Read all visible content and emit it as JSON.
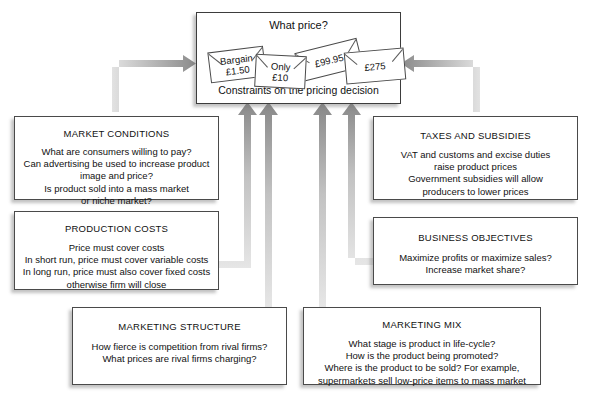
{
  "diagram": {
    "title": "Constraints on the pricing decision",
    "central": {
      "question": "What price?",
      "caption": "Constraints on the pricing decision",
      "price_tags": [
        {
          "name": "tag-bargain",
          "line1": "Bargain",
          "line2": "£1.50"
        },
        {
          "name": "tag-only-ten",
          "line1": "Only",
          "line2": "£10"
        },
        {
          "name": "tag-ninetynine",
          "line1": "£99.95",
          "line2": ""
        },
        {
          "name": "tag-twoseventyfive",
          "line1": "£275",
          "line2": ""
        }
      ]
    },
    "boxes": {
      "market_conditions": {
        "title": "MARKET CONDITIONS",
        "body": "What are consumers willing to pay?\nCan advertising be used to increase product\nimage and price?\nIs product sold into a mass market\nor niche market?"
      },
      "production_costs": {
        "title": "PRODUCTION COSTS",
        "body": "Price must cover costs\nIn short run, price must cover variable costs\nIn long run, price must also cover fixed costs\notherwise firm will close"
      },
      "taxes_and_subsidies": {
        "title": "TAXES AND SUBSIDIES",
        "body": "VAT and customs and excise duties\nraise product prices\nGovernment subsidies will allow\nproducers to lower prices"
      },
      "business_objectives": {
        "title": "BUSINESS OBJECTIVES",
        "body": "Maximize profits or maximize sales?\nIncrease market share?"
      },
      "marketing_structure": {
        "title": "MARKETING STRUCTURE",
        "body": "How fierce is competition from rival firms?\nWhat prices are rival firms charging?"
      },
      "marketing_mix": {
        "title": "MARKETING MIX",
        "body": "What stage is product in life-cycle?\nHow is the product being promoted?\nWhere is the product to be sold? For example,\nsupermarkets sell low-price items to mass market"
      }
    },
    "colors": {
      "background": "#ffffff",
      "box_border": "#4a4a4a",
      "text": "#111111",
      "arrow_dark": "#8a8a8a",
      "arrow_light": "#d9d9d9"
    },
    "connectors": [
      {
        "name": "connector-market-conditions",
        "from": "market_conditions",
        "to": "central",
        "shape": "elbow-up-right"
      },
      {
        "name": "connector-taxes-subsidies",
        "from": "taxes_and_subsidies",
        "to": "central",
        "shape": "elbow-up-left"
      },
      {
        "name": "connector-production-costs",
        "from": "production_costs",
        "to": "central",
        "shape": "elbow-right-up"
      },
      {
        "name": "connector-business-objectives",
        "from": "business_objectives",
        "to": "central",
        "shape": "elbow-left-up"
      },
      {
        "name": "connector-marketing-structure",
        "from": "marketing_structure",
        "to": "central",
        "shape": "vertical-up"
      },
      {
        "name": "connector-marketing-mix",
        "from": "marketing_mix",
        "to": "central",
        "shape": "vertical-up"
      }
    ]
  }
}
